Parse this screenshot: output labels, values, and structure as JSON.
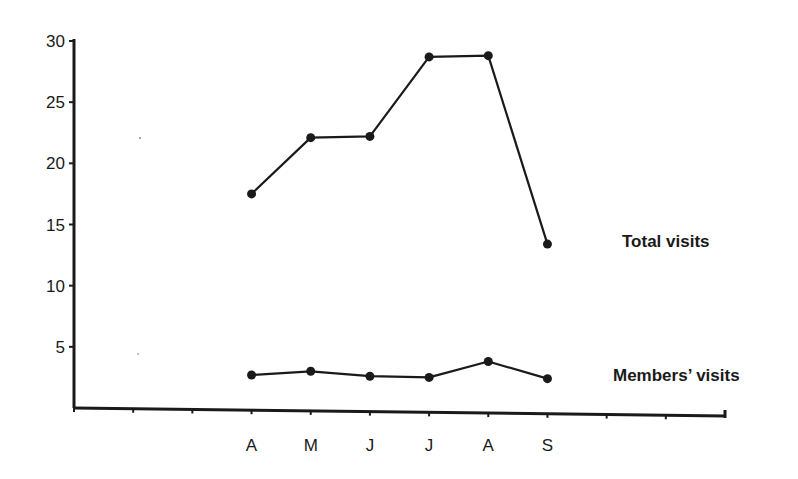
{
  "chart_data": {
    "type": "line",
    "title": "",
    "xlabel": "",
    "ylabel": "",
    "categories": [
      "A",
      "M",
      "J",
      "J",
      "A",
      "S"
    ],
    "x_axis_slots": 12,
    "x_label_start_slot": 3,
    "yticks": [
      5,
      10,
      15,
      20,
      25,
      30
    ],
    "ylim": [
      0,
      30
    ],
    "grid": false,
    "legend_position": "inline-right",
    "series": [
      {
        "name": "Total visits",
        "values": [
          17.5,
          22.1,
          22.2,
          28.7,
          28.8,
          13.4
        ],
        "color": "#1a1a1a"
      },
      {
        "name": "Members’ visits",
        "values": [
          2.7,
          3.0,
          2.6,
          2.5,
          3.8,
          2.4
        ],
        "color": "#1a1a1a"
      }
    ]
  },
  "labels": {
    "total": "Total visits",
    "members": "Members’ visits"
  }
}
